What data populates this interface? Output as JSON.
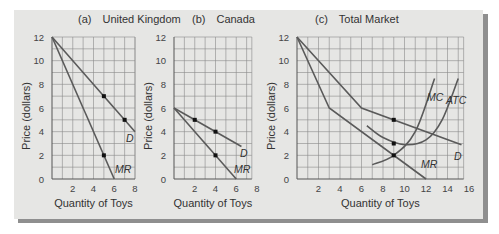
{
  "chart_data": [
    {
      "type": "line",
      "panel": "(a)",
      "title": "United Kingdom",
      "xlabel": "Quantity of Toys",
      "ylabel": "Price (dollars)",
      "xlim": [
        0,
        8
      ],
      "ylim": [
        0,
        12
      ],
      "xticks": [
        2,
        4,
        6,
        8
      ],
      "yticks": [
        0,
        2,
        4,
        6,
        8,
        10,
        12
      ],
      "grid": true,
      "series": [
        {
          "name": "D",
          "x": [
            0,
            8
          ],
          "y": [
            12,
            4
          ]
        },
        {
          "name": "MR",
          "x": [
            0,
            6
          ],
          "y": [
            12,
            0
          ]
        }
      ],
      "points": [
        {
          "x": 5,
          "y": 7
        },
        {
          "x": 7,
          "y": 5
        },
        {
          "x": 5,
          "y": 2
        }
      ]
    },
    {
      "type": "line",
      "panel": "(b)",
      "title": "Canada",
      "xlabel": "Quantity of Toys",
      "ylabel": "Price (dollars)",
      "xlim": [
        0,
        8
      ],
      "ylim": [
        0,
        12
      ],
      "xticks": [
        2,
        4,
        6,
        8
      ],
      "yticks": [
        0,
        2,
        4,
        6,
        8,
        10,
        12
      ],
      "grid": true,
      "series": [
        {
          "name": "D",
          "x": [
            0,
            6.5
          ],
          "y": [
            6,
            2.75
          ]
        },
        {
          "name": "MR",
          "x": [
            0,
            6
          ],
          "y": [
            6,
            0
          ]
        }
      ],
      "points": [
        {
          "x": 2,
          "y": 5
        },
        {
          "x": 4,
          "y": 4
        },
        {
          "x": 4,
          "y": 2
        }
      ]
    },
    {
      "type": "line",
      "panel": "(c)",
      "title": "Total Market",
      "xlabel": "Quantity of Toys",
      "ylabel": "Price (dollars)",
      "xlim": [
        0,
        16
      ],
      "ylim": [
        0,
        12
      ],
      "xticks": [
        2,
        4,
        6,
        8,
        10,
        12,
        14,
        16
      ],
      "yticks": [
        0,
        2,
        4,
        6,
        8,
        10,
        12
      ],
      "grid": true,
      "series": [
        {
          "name": "D",
          "x": [
            0,
            6,
            15.3
          ],
          "y": [
            12,
            6,
            2.9
          ]
        },
        {
          "name": "MR",
          "x": [
            0,
            3,
            12
          ],
          "y": [
            12,
            6,
            0
          ]
        },
        {
          "name": "MC",
          "x": [
            7,
            9,
            11,
            12.8
          ],
          "y": [
            1.2,
            2,
            4,
            8.5
          ]
        },
        {
          "name": "ATC",
          "x": [
            6.5,
            8,
            10,
            12,
            13.5,
            15
          ],
          "y": [
            4.5,
            3.5,
            2.9,
            3.3,
            5,
            8.5
          ]
        }
      ],
      "points": [
        {
          "x": 9,
          "y": 5
        },
        {
          "x": 9,
          "y": 3
        },
        {
          "x": 9,
          "y": 2
        }
      ]
    }
  ],
  "panels": {
    "a": {
      "label": "(a)",
      "title": "United Kingdom"
    },
    "b": {
      "label": "(b)",
      "title": "Canada"
    },
    "c": {
      "label": "(c)",
      "title": "Total Market"
    }
  },
  "axis": {
    "xlabel": "Quantity of Toys",
    "ylabel": "Price (dollars)"
  },
  "curve_labels": {
    "D": "D",
    "MR": "MR",
    "MC": "MC",
    "ATC": "ATC"
  }
}
